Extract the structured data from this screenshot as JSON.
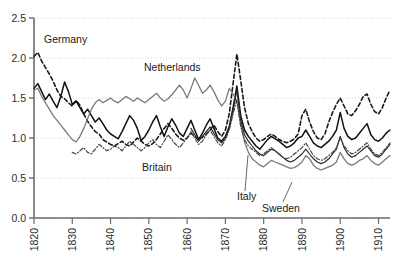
{
  "chart_data": {
    "type": "line",
    "title": "",
    "subtitle": "",
    "xlabel": "",
    "ylabel": "",
    "xlim": [
      1820,
      1913
    ],
    "ylim": [
      0.0,
      2.5
    ],
    "grid": true,
    "grid_axis": "y",
    "legend_position": "inline-annotations",
    "yticks": [
      0.0,
      0.5,
      1.0,
      1.5,
      2.0,
      2.5
    ],
    "ytick_labels": [
      "0.0",
      "0.5",
      "1.0",
      "1.5",
      "2.0",
      "2.5"
    ],
    "xticks": [
      1820,
      1830,
      1840,
      1850,
      1860,
      1870,
      1880,
      1890,
      1900,
      1910
    ],
    "xtick_labels": [
      "1820",
      "1830",
      "1840",
      "1850",
      "1860",
      "1870",
      "1880",
      "1890",
      "1900",
      "1910"
    ],
    "xtick_rotation": 90,
    "annotations": [
      {
        "text": "Germany",
        "x_px": 44,
        "y_px": 43,
        "leader": null
      },
      {
        "text": "Netherlands",
        "x_px": 144,
        "y_px": 71,
        "leader": null
      },
      {
        "text": "Britain",
        "x_px": 142,
        "y_px": 171,
        "leader": null
      },
      {
        "text": "Italy",
        "x_px": 237,
        "y_px": 200,
        "leader": {
          "x1": 245,
          "y1": 191,
          "x2": 248,
          "y2": 155
        }
      },
      {
        "text": "Sweden",
        "x_px": 262,
        "y_px": 212,
        "leader": {
          "x1": 283,
          "y1": 202,
          "x2": 292,
          "y2": 182
        }
      }
    ],
    "series": [
      {
        "name": "Germany",
        "style": "dashed",
        "color": "#1a1a1a",
        "width": 1.6,
        "x": [
          1820,
          1821,
          1822,
          1823,
          1824,
          1825,
          1826,
          1827,
          1828,
          1829,
          1830,
          1831,
          1832,
          1833,
          1834,
          1835,
          1836,
          1837,
          1838,
          1839,
          1840,
          1841,
          1842,
          1843,
          1844,
          1845,
          1846,
          1847,
          1848,
          1849,
          1850,
          1851,
          1852,
          1853,
          1854,
          1855,
          1856,
          1857,
          1858,
          1859,
          1860,
          1861,
          1862,
          1863,
          1864,
          1865,
          1866,
          1867,
          1868,
          1869,
          1870,
          1871,
          1872,
          1873,
          1874,
          1875,
          1876,
          1877,
          1878,
          1879,
          1880,
          1881,
          1882,
          1883,
          1884,
          1885,
          1886,
          1887,
          1888,
          1889,
          1890,
          1891,
          1892,
          1893,
          1894,
          1895,
          1896,
          1897,
          1898,
          1899,
          1900,
          1901,
          1902,
          1903,
          1904,
          1905,
          1906,
          1907,
          1908,
          1909,
          1910,
          1911,
          1912,
          1913
        ],
        "y": [
          2.02,
          2.07,
          1.96,
          1.88,
          1.8,
          1.71,
          1.6,
          1.52,
          1.49,
          1.44,
          1.4,
          1.47,
          1.41,
          1.3,
          1.21,
          1.14,
          1.08,
          1.05,
          0.98,
          0.95,
          0.92,
          0.9,
          0.93,
          0.96,
          0.92,
          0.9,
          0.95,
          1.0,
          0.96,
          0.92,
          0.9,
          0.93,
          0.98,
          1.05,
          1.12,
          1.18,
          1.12,
          1.05,
          1.0,
          0.97,
          1.0,
          1.06,
          1.02,
          0.98,
          1.01,
          1.05,
          1.1,
          1.16,
          1.08,
          1.02,
          1.1,
          1.3,
          1.68,
          2.05,
          1.72,
          1.38,
          1.18,
          1.08,
          1.0,
          0.96,
          0.98,
          1.02,
          1.05,
          1.02,
          0.98,
          0.96,
          0.94,
          0.96,
          0.99,
          1.05,
          1.28,
          1.36,
          1.2,
          1.08,
          1.0,
          0.98,
          1.05,
          1.2,
          1.32,
          1.42,
          1.5,
          1.4,
          1.3,
          1.28,
          1.34,
          1.42,
          1.52,
          1.55,
          1.42,
          1.33,
          1.3,
          1.38,
          1.5,
          1.6
        ]
      },
      {
        "name": "Britain",
        "style": "solid",
        "color": "#111111",
        "width": 1.5,
        "x": [
          1820,
          1821,
          1822,
          1823,
          1824,
          1825,
          1826,
          1827,
          1828,
          1829,
          1830,
          1831,
          1832,
          1833,
          1834,
          1835,
          1836,
          1837,
          1838,
          1839,
          1840,
          1841,
          1842,
          1843,
          1844,
          1845,
          1846,
          1847,
          1848,
          1849,
          1850,
          1851,
          1852,
          1853,
          1854,
          1855,
          1856,
          1857,
          1858,
          1859,
          1860,
          1861,
          1862,
          1863,
          1864,
          1865,
          1866,
          1867,
          1868,
          1869,
          1870,
          1871,
          1872,
          1873,
          1874,
          1875,
          1876,
          1877,
          1878,
          1879,
          1880,
          1881,
          1882,
          1883,
          1884,
          1885,
          1886,
          1887,
          1888,
          1889,
          1890,
          1891,
          1892,
          1893,
          1894,
          1895,
          1896,
          1897,
          1898,
          1899,
          1900,
          1901,
          1902,
          1903,
          1904,
          1905,
          1906,
          1907,
          1908,
          1909,
          1910,
          1911,
          1912,
          1913
        ],
        "y": [
          1.62,
          1.68,
          1.58,
          1.48,
          1.55,
          1.46,
          1.38,
          1.52,
          1.7,
          1.58,
          1.42,
          1.46,
          1.38,
          1.3,
          1.36,
          1.28,
          1.2,
          1.25,
          1.18,
          1.1,
          1.05,
          1.02,
          0.99,
          1.08,
          1.18,
          1.28,
          1.22,
          1.12,
          0.97,
          1.02,
          1.1,
          1.2,
          1.28,
          1.14,
          1.02,
          1.14,
          1.24,
          1.16,
          1.06,
          1.02,
          1.12,
          1.22,
          1.1,
          0.98,
          1.06,
          1.16,
          1.24,
          1.12,
          1.0,
          0.96,
          1.02,
          1.14,
          1.38,
          1.65,
          1.28,
          1.1,
          1.02,
          0.96,
          0.9,
          0.86,
          0.92,
          0.98,
          1.02,
          0.99,
          0.96,
          0.92,
          0.88,
          0.9,
          0.94,
          1.0,
          1.02,
          1.1,
          1.02,
          0.94,
          0.9,
          0.88,
          0.92,
          0.96,
          1.02,
          1.1,
          1.32,
          1.12,
          1.02,
          0.98,
          1.0,
          1.06,
          1.12,
          1.18,
          1.04,
          0.98,
          0.96,
          1.0,
          1.06,
          1.1
        ]
      },
      {
        "name": "Netherlands",
        "style": "solid",
        "color": "#7a7a7a",
        "width": 1.3,
        "x": [
          1820,
          1821,
          1822,
          1823,
          1824,
          1825,
          1826,
          1827,
          1828,
          1829,
          1830,
          1831,
          1832,
          1833,
          1834,
          1835,
          1836,
          1837,
          1838,
          1839,
          1840,
          1841,
          1842,
          1843,
          1844,
          1845,
          1846,
          1847,
          1848,
          1849,
          1850,
          1851,
          1852,
          1853,
          1854,
          1855,
          1856,
          1857,
          1858,
          1859,
          1860,
          1861,
          1862,
          1863,
          1864,
          1865,
          1866,
          1867,
          1868,
          1869,
          1870,
          1871,
          1872,
          1873,
          1874,
          1875,
          1876,
          1877,
          1878,
          1879,
          1880,
          1881,
          1882,
          1883,
          1884,
          1885,
          1886,
          1887,
          1888,
          1889,
          1890,
          1891,
          1892,
          1893,
          1894,
          1895,
          1896,
          1897,
          1898,
          1899,
          1900,
          1901,
          1902,
          1903,
          1904,
          1905,
          1906,
          1907,
          1908,
          1909,
          1910,
          1911,
          1912,
          1913
        ],
        "y": [
          1.6,
          1.62,
          1.52,
          1.44,
          1.36,
          1.28,
          1.22,
          1.16,
          1.1,
          1.04,
          0.98,
          0.95,
          1.02,
          1.12,
          1.24,
          1.36,
          1.44,
          1.48,
          1.44,
          1.47,
          1.5,
          1.46,
          1.44,
          1.48,
          1.52,
          1.49,
          1.46,
          1.5,
          1.47,
          1.44,
          1.48,
          1.52,
          1.56,
          1.5,
          1.46,
          1.49,
          1.54,
          1.6,
          1.66,
          1.6,
          1.5,
          1.62,
          1.75,
          1.66,
          1.56,
          1.6,
          1.66,
          1.58,
          1.48,
          1.4,
          1.46,
          1.62,
          1.55,
          1.45,
          1.18,
          0.95,
          0.82,
          0.74,
          0.7,
          0.66,
          0.64,
          0.68,
          0.72,
          0.7,
          0.68,
          0.66,
          0.64,
          0.62,
          0.63,
          0.66,
          0.7,
          0.78,
          0.74,
          0.66,
          0.62,
          0.6,
          0.62,
          0.64,
          0.66,
          0.7,
          0.82,
          0.74,
          0.68,
          0.66,
          0.68,
          0.72,
          0.74,
          0.78,
          0.72,
          0.68,
          0.66,
          0.7,
          0.74,
          0.78
        ]
      },
      {
        "name": "Italy",
        "style": "solid-dark",
        "color": "#2a2a2a",
        "width": 1.2,
        "x": [
          1861,
          1862,
          1863,
          1864,
          1865,
          1866,
          1867,
          1868,
          1869,
          1870,
          1871,
          1872,
          1873,
          1874,
          1875,
          1876,
          1877,
          1878,
          1879,
          1880,
          1881,
          1882,
          1883,
          1884,
          1885,
          1886,
          1887,
          1888,
          1889,
          1890,
          1891,
          1892,
          1893,
          1894,
          1895,
          1896,
          1897,
          1898,
          1899,
          1900,
          1901,
          1902,
          1903,
          1904,
          1905,
          1906,
          1907,
          1908,
          1909,
          1910,
          1911,
          1912,
          1913
        ],
        "y": [
          1.12,
          1.04,
          0.96,
          1.02,
          1.08,
          1.14,
          1.06,
          0.98,
          0.94,
          1.0,
          1.12,
          1.34,
          1.6,
          1.22,
          1.04,
          0.96,
          0.9,
          0.84,
          0.8,
          0.78,
          0.82,
          0.86,
          0.84,
          0.8,
          0.76,
          0.72,
          0.7,
          0.72,
          0.76,
          0.8,
          0.86,
          0.8,
          0.74,
          0.7,
          0.68,
          0.7,
          0.74,
          0.8,
          0.86,
          1.02,
          0.88,
          0.8,
          0.76,
          0.78,
          0.82,
          0.86,
          0.9,
          0.84,
          0.78,
          0.76,
          0.8,
          0.86,
          0.92
        ]
      },
      {
        "name": "Sweden",
        "style": "dash-dot",
        "color": "#444444",
        "width": 1.2,
        "x": [
          1830,
          1831,
          1832,
          1833,
          1834,
          1835,
          1836,
          1837,
          1838,
          1839,
          1840,
          1841,
          1842,
          1843,
          1844,
          1845,
          1846,
          1847,
          1848,
          1849,
          1850,
          1851,
          1852,
          1853,
          1854,
          1855,
          1856,
          1857,
          1858,
          1859,
          1860,
          1861,
          1862,
          1863,
          1864,
          1865,
          1866,
          1867,
          1868,
          1869,
          1870,
          1871,
          1872,
          1873,
          1874,
          1875,
          1876,
          1877,
          1878,
          1879,
          1880,
          1881,
          1882,
          1883,
          1884,
          1885,
          1886,
          1887,
          1888,
          1889,
          1890,
          1891,
          1892,
          1893,
          1894,
          1895,
          1896,
          1897,
          1898,
          1899,
          1900,
          1901,
          1902,
          1903,
          1904,
          1905,
          1906,
          1907,
          1908,
          1909,
          1910,
          1911,
          1912,
          1913
        ],
        "y": [
          0.82,
          0.8,
          0.84,
          0.88,
          0.82,
          0.8,
          0.86,
          0.92,
          0.88,
          0.84,
          0.86,
          0.9,
          0.88,
          0.84,
          0.9,
          0.96,
          0.92,
          0.88,
          0.84,
          0.88,
          0.94,
          0.98,
          0.92,
          0.88,
          0.96,
          1.04,
          0.98,
          0.92,
          0.88,
          0.94,
          1.0,
          1.08,
          1.0,
          0.92,
          0.96,
          1.04,
          1.1,
          1.02,
          0.94,
          0.9,
          0.98,
          1.1,
          1.3,
          1.48,
          1.14,
          0.98,
          0.9,
          0.86,
          0.82,
          0.78,
          0.8,
          0.84,
          0.88,
          0.84,
          0.8,
          0.76,
          0.74,
          0.76,
          0.8,
          0.84,
          0.88,
          0.94,
          0.86,
          0.78,
          0.74,
          0.72,
          0.74,
          0.78,
          0.82,
          0.88,
          1.0,
          0.9,
          0.84,
          0.8,
          0.82,
          0.86,
          0.9,
          0.94,
          0.86,
          0.8,
          0.78,
          0.82,
          0.88,
          0.94
        ]
      }
    ]
  },
  "axes": {
    "y_axis_name": "y-axis",
    "x_axis_name": "x-axis"
  },
  "colors": {
    "axis": "#6b6b6b",
    "grid": "#c9c9c9",
    "text": "#2b2b2b",
    "background": "#ffffff"
  }
}
